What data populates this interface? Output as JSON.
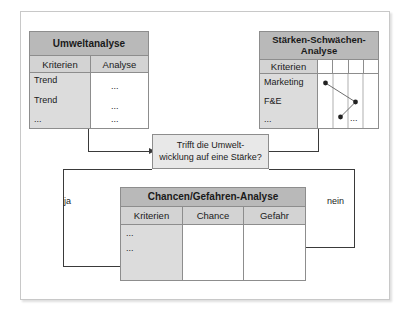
{
  "diagram": {
    "title_hidden": "Chancen-Gefahren-Analyse Ableitungsschema",
    "colors": {
      "header_fill": "#b9b9b9",
      "colhead_fill": "#d3d3d3",
      "kriterien_fill": "#dcdcdc",
      "decision_fill": "#e8e8e8",
      "line": "#3a3a3a",
      "border": "#8d8d8d",
      "frame": "#c8c8c8"
    }
  },
  "umwelt_table": {
    "title": "Umweltanalyse",
    "columns": [
      "Kriterien",
      "Analyse"
    ],
    "rows": [
      {
        "kriterium": "Trend",
        "analyse": "..."
      },
      {
        "kriterium": "Trend",
        "analyse": "..."
      },
      {
        "kriterium": "...",
        "analyse": "..."
      }
    ]
  },
  "staerken_table": {
    "title_line1": "Stärken-Schwächen-",
    "title_line2": "Analyse",
    "columns": [
      "Kriterien"
    ],
    "rows": [
      {
        "kriterium": "Marketing"
      },
      {
        "kriterium": "F&E"
      },
      {
        "kriterium": "..."
      }
    ],
    "chart_dots_label": "...",
    "chart": {
      "grid_columns": 4,
      "points": [
        {
          "col": 1,
          "row": "Marketing"
        },
        {
          "col": 3,
          "row": "between"
        },
        {
          "col": 2,
          "row": "F&E"
        }
      ]
    }
  },
  "decision": {
    "line1": "Trifft die Umwelt-",
    "line2": "wicklung auf eine Stärke?"
  },
  "edges": {
    "yes_label": "ja",
    "no_label": "nein"
  },
  "chancen_table": {
    "title": "Chancen/Gefahren-Analyse",
    "columns": [
      "Kriterien",
      "Chance",
      "Gefahr"
    ],
    "rows": [
      {
        "kriterium": "..."
      },
      {
        "kriterium": "..."
      }
    ]
  }
}
